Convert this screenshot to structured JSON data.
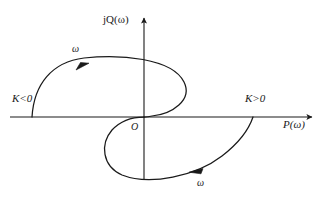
{
  "figure": {
    "name": "nyquist-plot",
    "background_color": "#ffffff",
    "stroke_color": "#1a1a1a"
  },
  "axes": {
    "x_axis": {
      "label": "P(ω)",
      "name": "real-axis",
      "y_pixel": 117,
      "x_start": 10,
      "x_end": 312,
      "arrow": "right"
    },
    "y_axis": {
      "label": "jQ(ω)",
      "name": "imaginary-axis",
      "x_pixel": 144,
      "y_start": 180,
      "y_end": 18,
      "arrow": "up"
    },
    "origin_label": "O"
  },
  "annotations": {
    "k_negative": "K<0",
    "k_positive": "K>0",
    "omega_upper": "ω",
    "omega_lower": "ω"
  },
  "chart_data": {
    "type": "line",
    "title": "",
    "xlabel": "P(ω)",
    "ylabel": "jQ(ω)",
    "grid": false,
    "legend": false,
    "axis_origin_px": [
      144,
      117
    ],
    "series": [
      {
        "name": "K<0 branch",
        "label": "K<0",
        "direction_marker": "ω",
        "arrow_direction": "clockwise-upper",
        "arrow_point_px": [
          82,
          65
        ],
        "start_point_px": [
          32,
          117
        ],
        "end_point_px": [
          144,
          117
        ],
        "path": "M 32 117 C 34 84, 52 62, 84 58 C 120 54, 172 58, 184 82 C 193 100, 172 114, 152 116 C 148 117, 146 117, 144 117",
        "points_px": [
          [
            32,
            117
          ],
          [
            50,
            84
          ],
          [
            84,
            58
          ],
          [
            130,
            57
          ],
          [
            172,
            66
          ],
          [
            185,
            87
          ],
          [
            168,
            110
          ],
          [
            148,
            116
          ],
          [
            144,
            117
          ]
        ]
      },
      {
        "name": "K>0 branch",
        "label": "K>0",
        "direction_marker": "ω",
        "arrow_direction": "leftward-lower",
        "arrow_point_px": [
          196,
          172
        ],
        "start_point_px": [
          144,
          117
        ],
        "end_point_px": [
          253,
          117
        ],
        "path": "M 144 117 C 136 117, 122 119, 112 130 C 100 144, 102 166, 122 175 C 150 186, 196 176, 222 156 C 244 139, 250 126, 253 117",
        "points_px": [
          [
            144,
            117
          ],
          [
            120,
            124
          ],
          [
            106,
            142
          ],
          [
            114,
            168
          ],
          [
            145,
            178
          ],
          [
            196,
            172
          ],
          [
            230,
            148
          ],
          [
            253,
            117
          ]
        ]
      }
    ],
    "markers": [
      {
        "name": "omega-arrow-upper",
        "px": [
          82,
          65
        ],
        "symbol": "ω",
        "points": "right-up"
      },
      {
        "name": "omega-arrow-lower",
        "px": [
          196,
          172
        ],
        "symbol": "ω",
        "points": "left"
      }
    ]
  }
}
